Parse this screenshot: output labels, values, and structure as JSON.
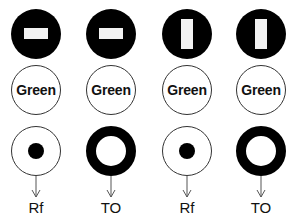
{
  "columns": [
    {
      "top_symbol": "horizontal-bar",
      "middle_label": "Green",
      "bottom_symbol": "dot",
      "output_label": "Rf"
    },
    {
      "top_symbol": "horizontal-bar",
      "middle_label": "Green",
      "bottom_symbol": "ring",
      "output_label": "TO"
    },
    {
      "top_symbol": "vertical-bar",
      "middle_label": "Green",
      "bottom_symbol": "dot",
      "output_label": "Rf"
    },
    {
      "top_symbol": "vertical-bar",
      "middle_label": "Green",
      "bottom_symbol": "ring",
      "output_label": "TO"
    }
  ],
  "colors": {
    "fill": "#000000",
    "background": "#ffffff",
    "bar": "#f2f2f2",
    "outline": "#333333"
  }
}
